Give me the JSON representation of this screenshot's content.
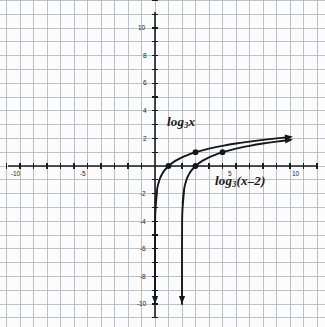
{
  "figure": {
    "kind": "coordinate-grid-graph",
    "background_color": "#fcfcfc",
    "grid_color": "#b9bcc4",
    "grid_minor_color": "#dfe1e6",
    "axis_color": "#1b1c20",
    "curve_color": "#16171b"
  },
  "axes": {
    "x": {
      "label_values": [
        "-10",
        "-5",
        "5",
        "10"
      ],
      "range": [
        -11.4,
        12.5
      ],
      "ticks_every": 1,
      "origin_px": [
        155,
        166
      ],
      "unit_px": 13.5
    },
    "y": {
      "label_values": [
        "10",
        "8",
        "6",
        "4",
        "2",
        "-2",
        "-4",
        "-6",
        "-8",
        "-10"
      ],
      "range": [
        -11.6,
        11.2
      ],
      "ticks_every": 1,
      "unit_px": 13.8
    }
  },
  "labels": {
    "curve1": {
      "base": "log",
      "sub": "3",
      "arg": "x"
    },
    "curve2": {
      "base": "log",
      "sub": "3",
      "arg": "(x–2)"
    }
  },
  "chart_data": {
    "type": "line",
    "title": "",
    "xlabel": "",
    "ylabel": "",
    "xlim": [
      -11.4,
      12.5
    ],
    "ylim": [
      -11.6,
      11.2
    ],
    "grid": true,
    "legend": "inline-curve-labels",
    "series": [
      {
        "name": "log_3 x",
        "equation": "y = log3(x)",
        "vertical_asymptote": 0,
        "marked_points": [
          [
            1,
            0
          ],
          [
            3,
            1
          ]
        ],
        "arrow_end": [
          10,
          2
        ],
        "arrow_start": [
          0.05,
          -10
        ],
        "points": [
          [
            0.05,
            -2.73
          ],
          [
            0.1,
            -2.1
          ],
          [
            0.15,
            -1.73
          ],
          [
            0.2,
            -1.46
          ],
          [
            0.3,
            -1.1
          ],
          [
            0.4,
            -0.83
          ],
          [
            0.5,
            -0.63
          ],
          [
            0.7,
            -0.32
          ],
          [
            1,
            0
          ],
          [
            1.5,
            0.37
          ],
          [
            2,
            0.63
          ],
          [
            2.5,
            0.83
          ],
          [
            3,
            1
          ],
          [
            4,
            1.26
          ],
          [
            5,
            1.46
          ],
          [
            6,
            1.63
          ],
          [
            7,
            1.77
          ],
          [
            8,
            1.89
          ],
          [
            9,
            2.0
          ],
          [
            10,
            2.1
          ]
        ]
      },
      {
        "name": "log_3 (x-2)",
        "equation": "y = log3(x-2)",
        "vertical_asymptote": 2,
        "marked_points": [
          [
            3,
            0
          ],
          [
            5,
            1
          ]
        ],
        "arrow_end": [
          10,
          1.9
        ],
        "arrow_start": [
          2.05,
          -10
        ],
        "points": [
          [
            2.05,
            -2.73
          ],
          [
            2.1,
            -2.1
          ],
          [
            2.15,
            -1.73
          ],
          [
            2.2,
            -1.46
          ],
          [
            2.3,
            -1.1
          ],
          [
            2.4,
            -0.83
          ],
          [
            2.5,
            -0.63
          ],
          [
            2.7,
            -0.32
          ],
          [
            3,
            0
          ],
          [
            3.5,
            0.37
          ],
          [
            4,
            0.63
          ],
          [
            4.5,
            0.83
          ],
          [
            5,
            1
          ],
          [
            6,
            1.26
          ],
          [
            7,
            1.46
          ],
          [
            8,
            1.63
          ],
          [
            9,
            1.77
          ],
          [
            10,
            1.89
          ]
        ]
      }
    ]
  },
  "tick_labels_px": [
    {
      "text": "-10",
      "left": 11,
      "top": 170
    },
    {
      "text": "-5",
      "left": 80,
      "top": 170
    },
    {
      "text": "5",
      "left": 228,
      "top": 170
    },
    {
      "text": "10",
      "left": 292,
      "top": 170
    },
    {
      "text": "10",
      "left": 138,
      "top": 24
    },
    {
      "text": "8",
      "left": 143,
      "top": 52
    },
    {
      "text": "6",
      "left": 143,
      "top": 79
    },
    {
      "text": "4",
      "left": 143,
      "top": 107
    },
    {
      "text": "2",
      "left": 143,
      "top": 135
    },
    {
      "text": "-2",
      "left": 140,
      "top": 190
    },
    {
      "text": "-4",
      "left": 140,
      "top": 218
    },
    {
      "text": "-6",
      "left": 140,
      "top": 245
    },
    {
      "text": "-8",
      "left": 140,
      "top": 273
    },
    {
      "text": "-10",
      "left": 137,
      "top": 300
    }
  ]
}
